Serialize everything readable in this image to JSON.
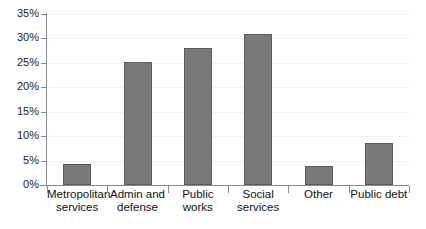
{
  "chart_data": {
    "type": "bar",
    "title": "",
    "subtitle": "",
    "xlabel": "",
    "ylabel": "",
    "categories": [
      "Metropolitan\nservices",
      "Admin and\ndefense",
      "Public\nworks",
      "Social\nservices",
      "Other",
      "Public debt"
    ],
    "values": [
      4.2,
      25.1,
      28.0,
      31.0,
      3.8,
      8.6
    ],
    "ylim": [
      0,
      35
    ],
    "ytick_values": [
      0,
      5,
      10,
      15,
      20,
      25,
      30,
      35
    ],
    "ytick_labels": [
      "0%",
      "5%",
      "10%",
      "15%",
      "20%",
      "25%",
      "30%",
      "35%"
    ],
    "grid": "horizontal",
    "legend": "none",
    "annotations": [],
    "colors": {
      "bar_fill": "#7a7a7a",
      "bar_border": "#5a5a5a",
      "gridline": "#f2f2f2",
      "axis": "#8a8a8a",
      "background": "#ffffff",
      "text": "#111111"
    }
  }
}
